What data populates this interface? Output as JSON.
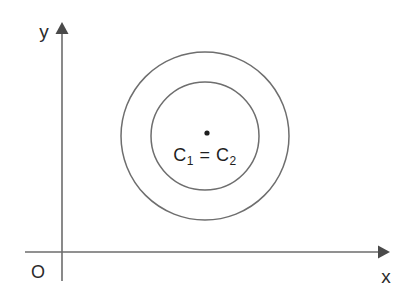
{
  "figure": {
    "type": "geometry-diagram",
    "background_color": "#ffffff",
    "line_color": "#6c6c6c",
    "text_color": "#2b2b2b",
    "dot_color": "#1e1e1e"
  },
  "axes": {
    "x_label": "x",
    "y_label": "y",
    "origin_label": "O",
    "x_axis": {
      "x1": 25,
      "y1": 252,
      "x2": 378,
      "y2": 252
    },
    "y_axis": {
      "x1": 62,
      "y1": 30,
      "x2": 62,
      "y2": 281
    },
    "x_arrow_tip": {
      "x": 390,
      "y": 252
    },
    "y_arrow_tip": {
      "x": 62,
      "y": 22
    },
    "x_label_pos": {
      "x": 386,
      "y": 283
    },
    "y_label_pos": {
      "x": 44,
      "y": 38
    },
    "origin_label_pos": {
      "x": 38,
      "y": 278
    }
  },
  "shapes": {
    "circles": [
      {
        "name": "outer-circle",
        "label": "C2",
        "cx": 205,
        "cy": 136,
        "r": 84
      },
      {
        "name": "inner-circle",
        "label": "C1",
        "cx": 205,
        "cy": 136,
        "r": 54
      }
    ],
    "center_point": {
      "name": "common-center",
      "cx": 207,
      "cy": 133,
      "r": 2.6
    }
  },
  "labels": {
    "center_equation": {
      "c1_letter": "C",
      "c1_sub": "1",
      "equals": "=",
      "c2_letter": "C",
      "c2_sub": "2",
      "full_text": "C1 = C2",
      "x": 205,
      "y": 161
    }
  }
}
